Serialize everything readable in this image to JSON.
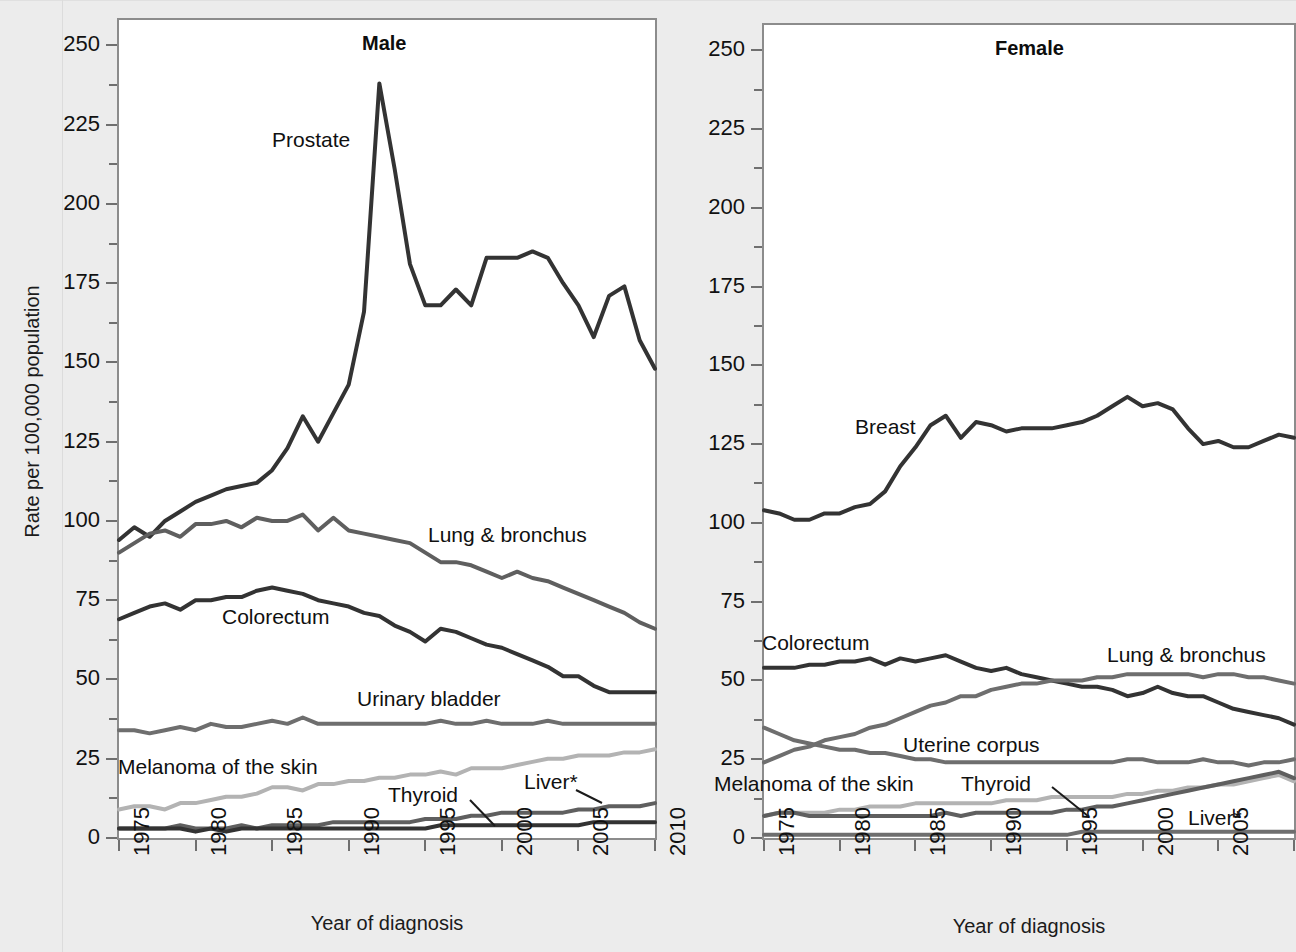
{
  "figure": {
    "y_axis_title": "Rate per 100,000 population",
    "x_axis_title": "Year of diagnosis",
    "y_ticks": [
      "0",
      "25",
      "50",
      "75",
      "100",
      "125",
      "150",
      "175",
      "200",
      "225",
      "250"
    ],
    "x_ticks": [
      "1975",
      "1980",
      "1985",
      "1990",
      "1995",
      "2000",
      "2005",
      "2010"
    ]
  },
  "panels": {
    "male": {
      "title": "Male",
      "x_axis_title": "Year of diagnosis",
      "labels": {
        "prostate": "Prostate",
        "lung": "Lung & bronchus",
        "colorectum": "Colorectum",
        "bladder": "Urinary bladder",
        "melanoma": "Melanoma of the skin",
        "thyroid": "Thyroid",
        "liver": "Liver*"
      }
    },
    "female": {
      "title": "Female",
      "x_axis_title": "Year of diagnosis",
      "labels": {
        "breast": "Breast",
        "colorectum": "Colorectum",
        "lung": "Lung & bronchus",
        "uterine": "Uterine corpus",
        "melanoma": "Melanoma of the skin",
        "thyroid": "Thyroid",
        "liver": "Liver*"
      }
    }
  },
  "colors": {
    "dark": "#333333",
    "medium": "#5f5f5f",
    "mid_gray": "#6e6e6e",
    "light_gray": "#b3b3b3",
    "axis": "#8c8c8c",
    "plot_bg": "#ffffff",
    "page_bg": "#ececec"
  },
  "chart_data": {
    "type": "line",
    "xlabel": "Year of diagnosis",
    "ylabel": "Rate per 100,000 population",
    "xlim": [
      1975,
      2010
    ],
    "ylim": [
      0,
      258
    ],
    "ytick_values": [
      0,
      25,
      50,
      75,
      100,
      125,
      150,
      175,
      200,
      225,
      250
    ],
    "ytick_minor_values": [
      12.5,
      37.5,
      62.5,
      87.5,
      112.5,
      137.5,
      162.5,
      187.5,
      212.5,
      237.5
    ],
    "xtick_values": [
      1975,
      1980,
      1985,
      1990,
      1995,
      2000,
      2005,
      2010
    ],
    "grid": false,
    "legend": "inline-labels",
    "x": [
      1975,
      1976,
      1977,
      1978,
      1979,
      1980,
      1981,
      1982,
      1983,
      1984,
      1985,
      1986,
      1987,
      1988,
      1989,
      1990,
      1991,
      1992,
      1993,
      1994,
      1995,
      1996,
      1997,
      1998,
      1999,
      2000,
      2001,
      2002,
      2003,
      2004,
      2005,
      2006,
      2007,
      2008,
      2009,
      2010
    ],
    "panels": [
      {
        "name": "Male",
        "series": [
          {
            "name": "Prostate",
            "color": "#333333",
            "values": [
              94,
              98,
              95,
              100,
              103,
              106,
              108,
              110,
              111,
              112,
              116,
              123,
              133,
              125,
              134,
              143,
              166,
              238,
              211,
              181,
              168,
              168,
              173,
              168,
              183,
              183,
              183,
              185,
              183,
              175,
              168,
              158,
              171,
              174,
              157,
              148
            ]
          },
          {
            "name": "Lung & bronchus",
            "color": "#5f5f5f",
            "values": [
              90,
              93,
              96,
              97,
              95,
              99,
              99,
              100,
              98,
              101,
              100,
              100,
              102,
              97,
              101,
              97,
              96,
              95,
              94,
              93,
              90,
              87,
              87,
              86,
              84,
              82,
              84,
              82,
              81,
              79,
              77,
              75,
              73,
              71,
              68,
              66
            ]
          },
          {
            "name": "Colorectum",
            "color": "#333333",
            "values": [
              69,
              71,
              73,
              74,
              72,
              75,
              75,
              76,
              76,
              78,
              79,
              78,
              77,
              75,
              74,
              73,
              71,
              70,
              67,
              65,
              62,
              66,
              65,
              63,
              61,
              60,
              58,
              56,
              54,
              51,
              51,
              48,
              46,
              46,
              46,
              46
            ]
          },
          {
            "name": "Urinary bladder",
            "color": "#6e6e6e",
            "values": [
              34,
              34,
              33,
              34,
              35,
              34,
              36,
              35,
              35,
              36,
              37,
              36,
              38,
              36,
              36,
              36,
              36,
              36,
              36,
              36,
              36,
              37,
              36,
              36,
              37,
              36,
              36,
              36,
              37,
              36,
              36,
              36,
              36,
              36,
              36,
              36
            ]
          },
          {
            "name": "Melanoma of the skin",
            "color": "#b3b3b3",
            "values": [
              9,
              10,
              10,
              9,
              11,
              11,
              12,
              13,
              13,
              14,
              16,
              16,
              15,
              17,
              17,
              18,
              18,
              19,
              19,
              20,
              20,
              21,
              20,
              22,
              22,
              22,
              23,
              24,
              25,
              25,
              26,
              26,
              26,
              27,
              27,
              28
            ]
          },
          {
            "name": "Thyroid",
            "color": "#5f5f5f",
            "values": [
              3,
              3,
              3,
              3,
              4,
              3,
              3,
              3,
              4,
              3,
              4,
              4,
              4,
              4,
              5,
              5,
              5,
              5,
              5,
              5,
              6,
              6,
              6,
              7,
              7,
              8,
              8,
              8,
              8,
              8,
              9,
              9,
              10,
              10,
              10,
              11
            ]
          },
          {
            "name": "Liver*",
            "color": "#333333",
            "values": [
              3,
              3,
              3,
              3,
              3,
              2,
              3,
              2,
              3,
              3,
              3,
              3,
              3,
              3,
              3,
              3,
              3,
              3,
              3,
              3,
              3,
              4,
              4,
              4,
              4,
              4,
              4,
              4,
              4,
              4,
              4,
              5,
              5,
              5,
              5,
              5
            ]
          }
        ]
      },
      {
        "name": "Female",
        "series": [
          {
            "name": "Breast",
            "color": "#333333",
            "values": [
              104,
              103,
              101,
              101,
              103,
              103,
              105,
              106,
              110,
              118,
              124,
              131,
              134,
              127,
              132,
              131,
              129,
              130,
              130,
              130,
              131,
              132,
              134,
              137,
              140,
              137,
              138,
              136,
              130,
              125,
              126,
              124,
              124,
              126,
              128,
              127
            ]
          },
          {
            "name": "Colorectum",
            "color": "#333333",
            "values": [
              54,
              54,
              54,
              55,
              55,
              56,
              56,
              57,
              55,
              57,
              56,
              57,
              58,
              56,
              54,
              53,
              54,
              52,
              51,
              50,
              49,
              48,
              48,
              47,
              45,
              46,
              48,
              46,
              45,
              45,
              43,
              41,
              40,
              39,
              38,
              36
            ]
          },
          {
            "name": "Lung & bronchus",
            "color": "#6e6e6e",
            "values": [
              24,
              26,
              28,
              29,
              31,
              32,
              33,
              35,
              36,
              38,
              40,
              42,
              43,
              45,
              45,
              47,
              48,
              49,
              49,
              50,
              50,
              50,
              51,
              51,
              52,
              52,
              52,
              52,
              52,
              51,
              52,
              52,
              51,
              51,
              50,
              49
            ]
          },
          {
            "name": "Uterine corpus",
            "color": "#6e6e6e",
            "values": [
              35,
              33,
              31,
              30,
              29,
              28,
              28,
              27,
              27,
              26,
              25,
              25,
              24,
              24,
              24,
              24,
              24,
              24,
              24,
              24,
              24,
              24,
              24,
              24,
              25,
              25,
              24,
              24,
              24,
              25,
              24,
              24,
              23,
              24,
              24,
              25
            ]
          },
          {
            "name": "Melanoma of the skin",
            "color": "#b3b3b3",
            "values": [
              7,
              8,
              8,
              8,
              8,
              9,
              9,
              10,
              10,
              10,
              11,
              11,
              11,
              11,
              11,
              11,
              12,
              12,
              12,
              13,
              13,
              13,
              13,
              13,
              14,
              14,
              15,
              15,
              16,
              16,
              17,
              17,
              18,
              19,
              20,
              18
            ]
          },
          {
            "name": "Thyroid",
            "color": "#5f5f5f",
            "values": [
              7,
              8,
              8,
              7,
              7,
              7,
              7,
              7,
              7,
              7,
              7,
              7,
              8,
              7,
              8,
              8,
              8,
              8,
              8,
              8,
              9,
              9,
              10,
              10,
              11,
              12,
              13,
              14,
              15,
              16,
              17,
              18,
              19,
              20,
              21,
              19
            ]
          },
          {
            "name": "Liver*",
            "color": "#6e6e6e",
            "values": [
              1,
              1,
              1,
              1,
              1,
              1,
              1,
              1,
              1,
              1,
              1,
              1,
              1,
              1,
              1,
              1,
              1,
              1,
              1,
              1,
              1,
              2,
              2,
              2,
              2,
              2,
              2,
              2,
              2,
              2,
              2,
              2,
              2,
              2,
              2,
              2
            ]
          }
        ]
      }
    ]
  }
}
